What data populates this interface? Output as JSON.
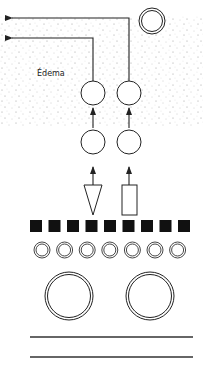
{
  "diagram": {
    "label": "Édema",
    "colors": {
      "stroke": "#222222",
      "fill_dark": "#111111",
      "stipple": "#8a8a8a",
      "background": "#ffffff"
    },
    "regions": {
      "edema_area": {
        "x": 0,
        "y": 16,
        "width": 203,
        "height": 110,
        "pattern": "stippled-dots"
      }
    },
    "elements": {
      "top_right_vessel": {
        "shape": "double-circle",
        "cx": 152,
        "cy": 21,
        "r": 13
      },
      "upper_circles": [
        {
          "shape": "circle",
          "cx": 93,
          "cy": 93,
          "r": 12
        },
        {
          "shape": "circle",
          "cx": 129,
          "cy": 93,
          "r": 12
        }
      ],
      "lower_circles": [
        {
          "shape": "circle",
          "cx": 93,
          "cy": 142,
          "r": 12
        },
        {
          "shape": "circle",
          "cx": 129,
          "cy": 142,
          "r": 12
        }
      ],
      "arrows_up": [
        {
          "x": 93,
          "y_from": 120,
          "y_to": 105
        },
        {
          "x": 129,
          "y_from": 120,
          "y_to": 105
        },
        {
          "x": 93,
          "y_from": 184,
          "y_to": 166
        },
        {
          "x": 129,
          "y_from": 184,
          "y_to": 166
        }
      ],
      "arrows_left": [
        {
          "from_x": 129,
          "from_y": 81,
          "corner_y": 18,
          "to_x": 10
        },
        {
          "from_x": 93,
          "from_y": 81,
          "corner_y": 38,
          "to_x": 10
        }
      ],
      "triangle": {
        "points": "84,185 102,185 93,215"
      },
      "rectangle": {
        "x": 122,
        "y": 185,
        "width": 15,
        "height": 30
      },
      "black_squares": {
        "count": 9,
        "x_start": 30,
        "y": 220,
        "size": 12,
        "step": 18.5
      },
      "small_double_circles": {
        "count": 7,
        "cx_start": 42,
        "cy": 250,
        "r": 8,
        "step": 22.6
      },
      "large_double_circles": [
        {
          "cx": 69,
          "cy": 296,
          "r": 24
        },
        {
          "cx": 150,
          "cy": 296,
          "r": 24
        }
      ],
      "horizontal_lines": [
        {
          "x1": 30,
          "x2": 193,
          "y": 337
        },
        {
          "x1": 30,
          "x2": 193,
          "y": 357
        }
      ]
    }
  }
}
